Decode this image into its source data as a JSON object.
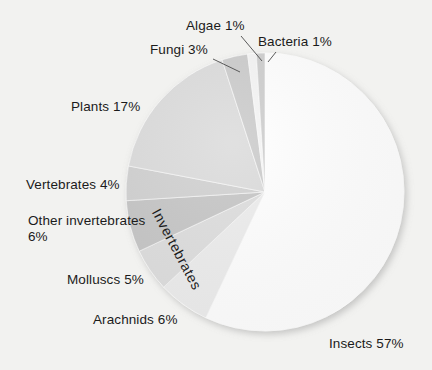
{
  "chart_data": {
    "type": "pie",
    "title": "",
    "subtitle": "",
    "xlabel": "",
    "ylabel": "",
    "legend_position": "none",
    "grid": false,
    "units": "percent",
    "categories": [
      "Insects",
      "Plants",
      "Arachnids",
      "Other invertebrates",
      "Molluscs",
      "Vertebrates",
      "Fungi",
      "Algae",
      "Bacteria"
    ],
    "values": [
      57,
      17,
      6,
      6,
      5,
      4,
      3,
      1,
      1
    ],
    "slices": [
      {
        "name": "Insects",
        "value": 57,
        "label": "Insects  57%",
        "color": "#ffffff"
      },
      {
        "name": "Arachnids",
        "value": 6,
        "label": "Arachnids 6%",
        "color": "#ececec"
      },
      {
        "name": "Molluscs",
        "value": 5,
        "label": "Molluscs 5%",
        "color": "#dcdcdc"
      },
      {
        "name": "Other invertebrates",
        "value": 6,
        "label": "Other invertebrates 6%",
        "color": "#c3c3c3"
      },
      {
        "name": "Vertebrates",
        "value": 4,
        "label": "Vertebrates  4%",
        "color": "#cfcfcf"
      },
      {
        "name": "Plants",
        "value": 17,
        "label": "Plants 17%",
        "color": "#dadada"
      },
      {
        "name": "Fungi",
        "value": 3,
        "label": "Fungi 3%",
        "color": "#c9c9c9"
      },
      {
        "name": "Algae",
        "value": 1,
        "label": "Algae 1%",
        "color": "#f4f4f4"
      },
      {
        "name": "Bacteria",
        "value": 1,
        "label": "Bacteria 1%",
        "color": "#cbcbcb"
      }
    ],
    "group_annotation": "Invertebrates",
    "background_color": "#f2f2f0",
    "text_color": "#1b1b1b"
  },
  "labels": {
    "algae": "Algae 1%",
    "bacteria": "Bacteria 1%",
    "fungi": "Fungi 3%",
    "plants": "Plants 17%",
    "vertebrates": "Vertebrates  4%",
    "other_invertebrates": "Other invertebrates 6%",
    "molluscs": "Molluscs 5%",
    "arachnids": "Arachnids 6%",
    "insects": "Insects  57%",
    "invertebrates_group": "Invertebrates"
  }
}
